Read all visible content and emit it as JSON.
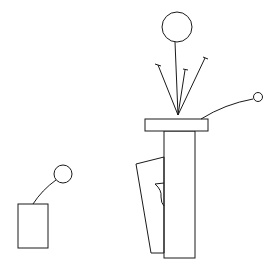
{
  "canvas": {
    "width": 280,
    "height": 269,
    "background": "#ffffff",
    "stroke_color": "#1a1a1a"
  },
  "figure": {
    "small_figure": {
      "box": {
        "x": 18,
        "y": 204,
        "w": 30,
        "h": 44
      },
      "head": {
        "cx": 63,
        "cy": 174,
        "r": 9
      },
      "neck": {
        "d": "M33,204 Q42,190 56,180"
      }
    },
    "large_figure": {
      "head": {
        "cx": 177,
        "cy": 27,
        "r": 15
      },
      "stem": {
        "x1": 175,
        "y1": 42,
        "x2": 178,
        "y2": 115
      },
      "fan_lines": [
        {
          "x1": 178,
          "y1": 115,
          "x2": 158,
          "y2": 65,
          "cap": "M155,64 L161,66"
        },
        {
          "x1": 178,
          "y1": 115,
          "x2": 185,
          "y2": 70,
          "cap": "M183,69 L188,70"
        },
        {
          "x1": 178,
          "y1": 115,
          "x2": 205,
          "y2": 58,
          "cap": "M203,57 L208,59"
        }
      ],
      "platform": {
        "x": 145,
        "y": 119,
        "w": 63,
        "h": 12
      },
      "column": {
        "x": 164,
        "y": 131,
        "w": 31,
        "h": 127
      },
      "panel": {
        "points": "136,164 164,157 164,253 151,253"
      },
      "hook": {
        "d": "M155,184 L164,183 M155,184 Q162,190 161,197 Q161,203 164,206"
      },
      "arm": {
        "d": "M201,119 Q225,104 253,99"
      },
      "hand": {
        "cx": 258,
        "cy": 97,
        "r": 4.5
      }
    }
  }
}
